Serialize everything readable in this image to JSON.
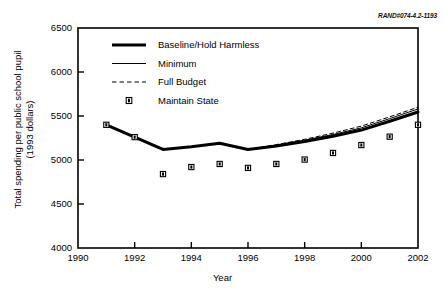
{
  "figure": {
    "rand_id": "RAND#074-4.2-1193"
  },
  "chart_data": {
    "type": "line",
    "title": "",
    "xlabel": "Year",
    "ylabel": "Total spending per public school pupil (1993 dollars)",
    "ylabel_line1": "Total spending per public school pupil",
    "ylabel_line2": "(1993 dollars)",
    "xlim": [
      1990,
      2002
    ],
    "ylim": [
      4000,
      6500
    ],
    "xticks": [
      1990,
      1992,
      1994,
      1996,
      1998,
      2000,
      2002
    ],
    "xtick_labels": [
      "1990",
      "1992",
      "1994",
      "1996",
      "1998",
      "2000",
      "2002"
    ],
    "yticks": [
      4000,
      4500,
      5000,
      5500,
      6000,
      6500
    ],
    "ytick_labels": [
      "4000",
      "4500",
      "5000",
      "5500",
      "6000",
      "6500"
    ],
    "grid": false,
    "legend_position": "upper-left-inside",
    "x": [
      1991,
      1992,
      1993,
      1994,
      1995,
      1996,
      1997,
      1998,
      1999,
      2000,
      2001,
      2002
    ],
    "series": [
      {
        "name": "Baseline/Hold Harmless",
        "style": "thick-solid",
        "color": "#000000",
        "values": [
          5400,
          5260,
          5120,
          5150,
          5190,
          5120,
          5160,
          5210,
          5270,
          5340,
          5440,
          5545
        ]
      },
      {
        "name": "Minimum",
        "style": "thin-solid",
        "color": "#000000",
        "values": [
          5400,
          5260,
          5120,
          5150,
          5190,
          5120,
          5170,
          5225,
          5290,
          5365,
          5470,
          5580
        ]
      },
      {
        "name": "Full Budget",
        "style": "dashed",
        "color": "#000000",
        "values": [
          5400,
          5260,
          5120,
          5150,
          5190,
          5120,
          5175,
          5235,
          5305,
          5385,
          5490,
          5600
        ]
      },
      {
        "name": "Maintain State",
        "style": "square-marker",
        "color": "#000000",
        "values": [
          5400,
          5260,
          4840,
          4920,
          4955,
          4910,
          4955,
          5005,
          5080,
          5170,
          5265,
          5400
        ]
      }
    ]
  },
  "legend": {
    "items": [
      {
        "label": "Baseline/Hold Harmless",
        "style": "thick-solid"
      },
      {
        "label": "Minimum",
        "style": "thin-solid"
      },
      {
        "label": "Full Budget",
        "style": "dashed"
      },
      {
        "label": "Maintain State",
        "style": "square-marker"
      }
    ]
  }
}
